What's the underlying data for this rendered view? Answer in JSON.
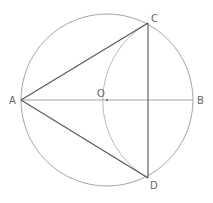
{
  "diagram": {
    "points": {
      "A": "A",
      "B": "B",
      "C": "C",
      "D": "D",
      "O": "O"
    },
    "colors": {
      "circle": "#9a9a9a",
      "triangle": "#555555",
      "label": "#666666"
    }
  }
}
